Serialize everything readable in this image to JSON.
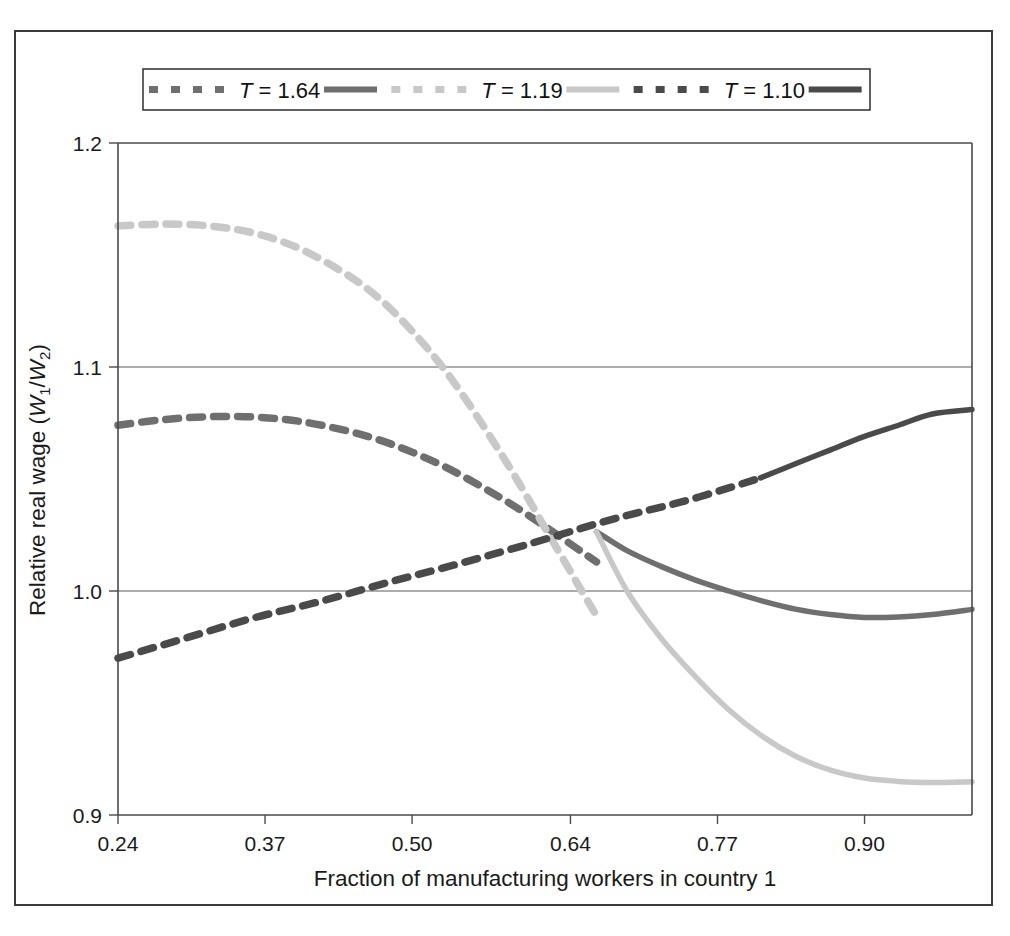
{
  "figure": {
    "background_color": "#ffffff",
    "frame_color": "#3a3a3a"
  },
  "legend": {
    "position": "top-center",
    "entries": [
      {
        "label_prefix": "T",
        "label_equals": "= 1.64",
        "color": "#6f6f6f",
        "dash_sample": "dashed",
        "solid_sample": "solid"
      },
      {
        "label_prefix": "T",
        "label_equals": "= 1.19",
        "color": "#c8c8c8",
        "dash_sample": "dashed",
        "solid_sample": "solid"
      },
      {
        "label_prefix": "T",
        "label_equals": "= 1.10",
        "color": "#4a4a4a",
        "dash_sample": "dashed",
        "solid_sample": "solid"
      }
    ]
  },
  "chart_data": {
    "type": "line",
    "title": "",
    "xlabel": "Fraction of manufacturing workers in country 1",
    "ylabel": "Relative real wage (W1/W2)",
    "ylabel_parts": {
      "text": "Relative real wage (",
      "w": "W",
      "sub1": "1",
      "slash": "/",
      "w2": "W",
      "sub2": "2",
      "close": ")"
    },
    "xlim": [
      0.24,
      0.995
    ],
    "ylim": [
      0.9,
      1.2
    ],
    "xticks": [
      0.24,
      0.37,
      0.5,
      0.64,
      0.77,
      0.9
    ],
    "xticklabels": [
      "0.24",
      "0.37",
      "0.50",
      "0.64",
      "0.77",
      "0.90"
    ],
    "yticks": [
      0.9,
      1.0,
      1.1,
      1.2
    ],
    "yticklabels": [
      "0.9",
      "1.0",
      "1.1",
      "1.2"
    ],
    "grid": "horizontal-at-1.0-and-1.1",
    "legend_position": "top-center",
    "series": [
      {
        "name": "T = 1.64",
        "color": "#6f6f6f",
        "style_note": "dashed from x=0.24 to branch point, then solid declining branch",
        "dashed": {
          "x": [
            0.24,
            0.28,
            0.32,
            0.36,
            0.4,
            0.44,
            0.47,
            0.5,
            0.53,
            0.56,
            0.59,
            0.62,
            0.65,
            0.663
          ],
          "y": [
            1.074,
            1.0765,
            1.0778,
            1.0777,
            1.0758,
            1.0718,
            1.0676,
            1.062,
            1.0552,
            1.047,
            1.038,
            1.028,
            1.0175,
            1.013
          ]
        },
        "solid": {
          "x": [
            0.663,
            0.69,
            0.72,
            0.75,
            0.78,
            0.81,
            0.84,
            0.87,
            0.9,
            0.93,
            0.96,
            0.995
          ],
          "y": [
            1.0265,
            1.018,
            1.011,
            1.005,
            1.0,
            0.9955,
            0.9918,
            0.9895,
            0.9882,
            0.9884,
            0.9895,
            0.9918
          ]
        }
      },
      {
        "name": "T = 1.19",
        "color": "#c8c8c8",
        "style_note": "dashed from x=0.24 to branch point, then solid steeply declining branch",
        "dashed": {
          "x": [
            0.24,
            0.28,
            0.32,
            0.36,
            0.4,
            0.44,
            0.47,
            0.5,
            0.53,
            0.56,
            0.59,
            0.62,
            0.65,
            0.663
          ],
          "y": [
            1.163,
            1.1638,
            1.163,
            1.1598,
            1.153,
            1.142,
            1.131,
            1.116,
            1.098,
            1.076,
            1.052,
            1.026,
            1.0,
            0.989
          ]
        },
        "solid": {
          "x": [
            0.663,
            0.69,
            0.72,
            0.75,
            0.78,
            0.81,
            0.84,
            0.87,
            0.9,
            0.93,
            0.96,
            0.995
          ],
          "y": [
            1.0265,
            1.0,
            0.979,
            0.962,
            0.947,
            0.935,
            0.926,
            0.92,
            0.9165,
            0.915,
            0.9145,
            0.9148
          ]
        }
      },
      {
        "name": "T = 1.10",
        "color": "#4a4a4a",
        "style_note": "dashed rising from x=0.24 to x=0.808, then solid continuing to rise",
        "dashed": {
          "x": [
            0.24,
            0.3,
            0.36,
            0.42,
            0.48,
            0.54,
            0.6,
            0.663,
            0.7,
            0.74,
            0.78,
            0.808
          ],
          "y": [
            0.97,
            0.979,
            0.988,
            0.9955,
            1.004,
            1.012,
            1.0205,
            1.03,
            1.035,
            1.04,
            1.046,
            1.0505
          ]
        },
        "solid": {
          "x": [
            0.808,
            0.84,
            0.87,
            0.9,
            0.93,
            0.96,
            0.995
          ],
          "y": [
            1.0505,
            1.057,
            1.063,
            1.069,
            1.074,
            1.079,
            1.081
          ]
        }
      }
    ]
  }
}
